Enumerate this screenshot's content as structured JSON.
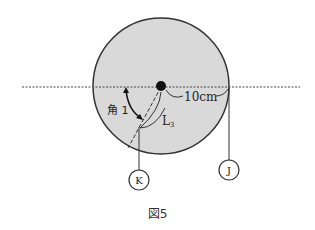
{
  "figure": {
    "caption": "図5",
    "radius_label": "10cm",
    "angle_label": "角 1",
    "length_label": "L",
    "length_subscript": "3",
    "point_k": "K",
    "point_j": "J"
  },
  "colors": {
    "disc_fill": "#d9d9d9",
    "stroke": "#333333"
  }
}
